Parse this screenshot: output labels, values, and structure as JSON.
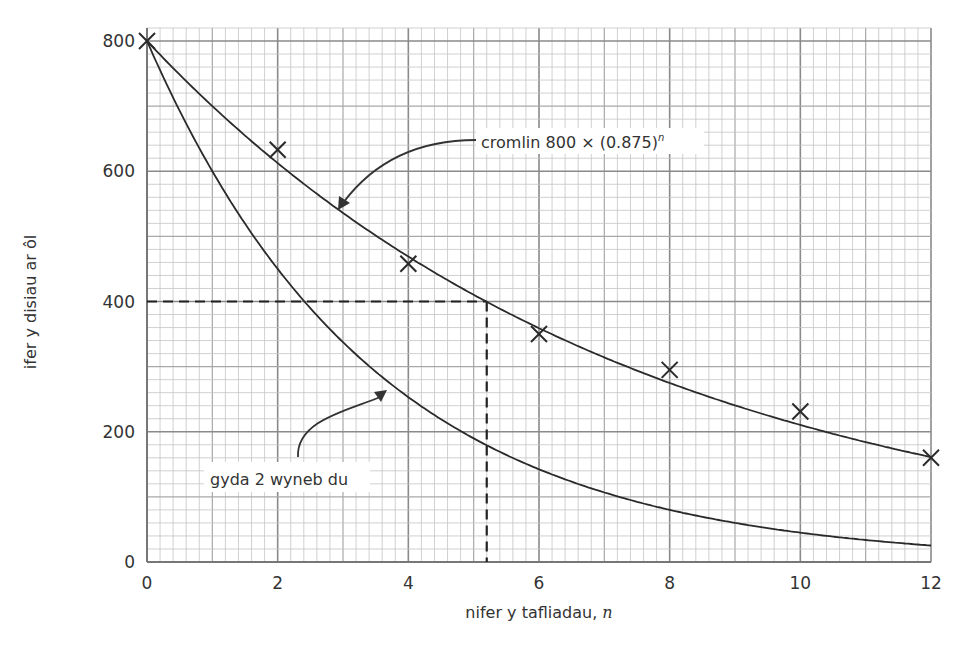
{
  "chart_data": {
    "type": "line",
    "title": "",
    "xlabel": "nifer y tafliadau, n",
    "xlabel_text": "nifer y tafliadau, ",
    "xlabel_var": "n",
    "ylabel": "ifer y disiau ar ôl",
    "xlim": [
      0,
      12
    ],
    "ylim": [
      0,
      820
    ],
    "x_ticks": [
      0,
      2,
      4,
      6,
      8,
      10,
      12
    ],
    "y_ticks": [
      0,
      200,
      400,
      600,
      800
    ],
    "grid": {
      "on": true,
      "x_minor_step": 0.2,
      "x_major_step": 1,
      "x_bold_step": 2,
      "y_minor_step": 20,
      "y_major_step": 100,
      "y_bold_step": 200
    },
    "series": [
      {
        "name": "cromlin 800 × (0.875)^n",
        "kind": "curve",
        "formula": "800 * 0.875^n",
        "base": 0.875,
        "x": [
          0,
          1,
          2,
          3,
          4,
          5,
          6,
          7,
          8,
          9,
          10,
          11,
          12
        ],
        "values": [
          800,
          700,
          612.5,
          536,
          469,
          410,
          359,
          314,
          275,
          240,
          210,
          184,
          161
        ]
      },
      {
        "name": "gyda 2 wyneb du",
        "kind": "curve",
        "formula": "800 * 0.75^n",
        "base": 0.75,
        "x": [
          0,
          1,
          2,
          3,
          4,
          5,
          6,
          7,
          8,
          9,
          10,
          11,
          12
        ],
        "values": [
          800,
          600,
          450,
          338,
          253,
          190,
          142,
          107,
          80,
          60,
          45,
          34,
          25
        ]
      },
      {
        "name": "observed",
        "kind": "scatter",
        "marker": "x",
        "x": [
          0,
          2,
          4,
          6,
          8,
          10,
          12
        ],
        "values": [
          800,
          633,
          458,
          350,
          295,
          231,
          160
        ]
      }
    ],
    "reference_lines": {
      "y_value": 400,
      "x_value": 5.2,
      "style": "dashed"
    },
    "annotations": [
      {
        "text_main": "cromlin 800 × (0.875)",
        "text_sup": "n",
        "points_to": "upper curve"
      },
      {
        "text_main": "gyda 2 wyneb du",
        "points_to": "lower curve"
      }
    ]
  }
}
